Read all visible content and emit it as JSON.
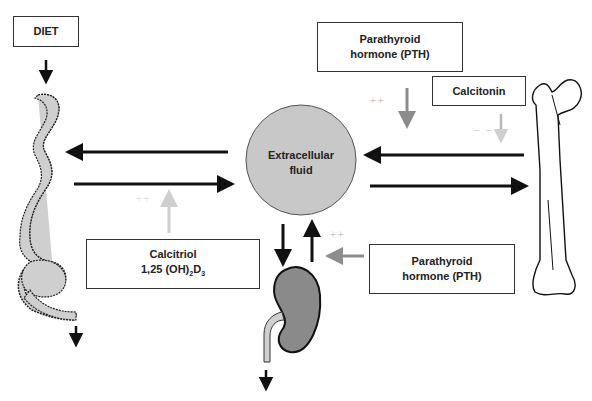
{
  "diagram": {
    "nodes": {
      "diet": {
        "label": "DIET"
      },
      "ecf": {
        "line1": "Extracellular",
        "line2": "fluid"
      },
      "pth_top": {
        "line1": "Parathyroid",
        "line2": "hormone (PTH)"
      },
      "calcitonin": {
        "label": "Calcitonin"
      },
      "calcitriol": {
        "line1": "Calcitriol",
        "line2_pre": "1,25 (OH)",
        "sub1": "2",
        "line2_mid": "D",
        "sub2": "3"
      },
      "pth_bottom": {
        "line1": "Parathyroid",
        "line2": "hormone (PTH)"
      },
      "intestine": {
        "label": "intestine"
      },
      "kidney": {
        "label": "kidney"
      },
      "bone": {
        "label": "bone"
      }
    },
    "modifiers": {
      "pth_bone": "++",
      "calcitonin_bone": "– –",
      "calcitriol_gut": "++",
      "pth_kidney": "++"
    },
    "colors": {
      "ecf_fill": "#c8c8c8",
      "gut_fill": "#cfcfcf",
      "kidney_fill": "#8a8a8a",
      "arrow_dark": "#111111",
      "arrow_mid": "#8c8c8c",
      "arrow_light": "#cccccc"
    }
  }
}
